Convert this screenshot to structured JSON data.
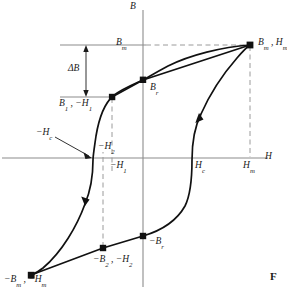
{
  "figure": {
    "kind": "magnetic-hysteresis-loop",
    "figure_tag": "F",
    "axes": {
      "vertical_label": "B",
      "horizontal_label": "H",
      "origin_px": [
        143,
        158
      ],
      "axis_color": "#808080"
    },
    "labels": {
      "b_max": "Bm",
      "delta_b": "ΔB",
      "b1_minus_h1": "B1 , −H1",
      "b_r": "Br",
      "minus_h_c": "−Hc",
      "minus_h_2": "−H2",
      "minus_h_1": "−H1",
      "h_c": "Hc",
      "h_m": "Hm",
      "bm_hm": "Bm , Hm",
      "minus_b_r": "−Br",
      "minus_b2_minus_h2": "−B2 , −H2",
      "minus_bm_minus_hm": "−Bm , −Hm"
    },
    "curve_color": "#111111",
    "dash_color": "#9a9a9a",
    "guide_color": "#8c8c8c",
    "marked_points": [
      {
        "name": "Bm,Hm tip (upper saturation)",
        "px": [
          250,
          45
        ]
      },
      {
        "name": "Br (remanence, positive)",
        "px": [
          143,
          80
        ]
      },
      {
        "name": "B1,-H1 (minor loop tip)",
        "px": [
          112,
          97
        ]
      },
      {
        "name": "-Hc (coercivity, negative)",
        "px": [
          93,
          158
        ]
      },
      {
        "name": "-Br (remanence, negative)",
        "px": [
          143,
          236
        ]
      },
      {
        "name": "-B2,-H2 (minor loop tip)",
        "px": [
          103,
          248
        ]
      },
      {
        "name": "-Bm,-Hm tip (lower saturation)",
        "px": [
          31,
          275
        ]
      },
      {
        "name": "Hc (coercivity, positive)",
        "px": [
          192,
          158
        ]
      }
    ],
    "arrow_directions": [
      {
        "name": "descending-branch-arrow",
        "px": [
          85,
          201
        ],
        "points": "down-left"
      },
      {
        "name": "ascending-branch-arrow",
        "px": [
          199,
          119
        ],
        "points": "up-right"
      }
    ]
  }
}
